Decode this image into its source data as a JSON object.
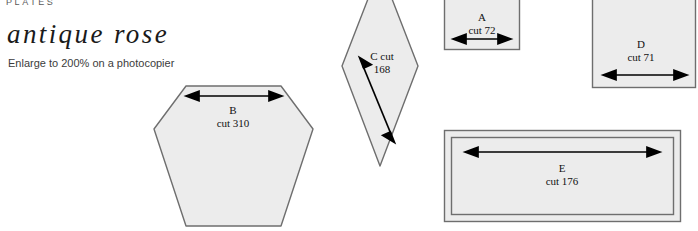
{
  "header": {
    "kicker": "PLATES",
    "title": "antique rose",
    "subtitle": "Enlarge to 200% on a photocopier"
  },
  "colors": {
    "page_background": "#ffffff",
    "piece_fill": "#ececec",
    "piece_stroke": "#6e6e6e",
    "arrow": "#000000",
    "text": "#111111",
    "kicker_text": "#5a5a5a"
  },
  "pieces": [
    {
      "id": "B",
      "shape": "hexagon",
      "letter": "B",
      "cut_label": "cut 310",
      "cut_count": 310,
      "arrow": "horizontal-double"
    },
    {
      "id": "C",
      "shape": "diamond",
      "letter": "C cut",
      "cut_label": "168",
      "cut_count": 168,
      "arrow": "diagonal-double"
    },
    {
      "id": "A",
      "shape": "square",
      "letter": "A",
      "cut_label": "cut 72",
      "cut_count": 72,
      "arrow": "horizontal-double"
    },
    {
      "id": "D",
      "shape": "square",
      "letter": "D",
      "cut_label": "cut 71",
      "cut_count": 71,
      "arrow": "horizontal-double"
    },
    {
      "id": "E",
      "shape": "rectangle-bordered",
      "letter": "E",
      "cut_label": "cut 176",
      "cut_count": 176,
      "arrow": "horizontal-double"
    }
  ]
}
